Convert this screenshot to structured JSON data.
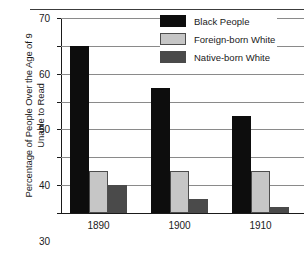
{
  "chart_data": {
    "type": "bar",
    "title": "",
    "xlabel": "",
    "ylabel_line1": "Percentage of People Over the Age of 9",
    "ylabel_line2": "Unable to Read",
    "categories": [
      "1890",
      "1900",
      "1910"
    ],
    "series": [
      {
        "name": "Black People",
        "color": "#0d0d0d",
        "values": [
          60,
          45,
          35
        ]
      },
      {
        "name": "Foreign-born White",
        "color": "#c6c6c6",
        "values": [
          15,
          15,
          15
        ]
      },
      {
        "name": "Native-born White",
        "color": "#4a4a4a",
        "values": [
          10,
          5,
          2
        ]
      }
    ],
    "ylim": [
      0,
      70
    ],
    "ytick_labels": [
      "0",
      "10",
      "20",
      "30",
      "40",
      "50",
      "60",
      "70"
    ],
    "ytick_values": [
      0,
      10,
      20,
      30,
      40,
      50,
      60,
      70
    ],
    "grid": true,
    "legend_position": "top-right"
  },
  "legend": {
    "items": [
      {
        "label": "Black People",
        "swatch": "black-swatch"
      },
      {
        "label": "Foreign-born White",
        "swatch": "light-gray-swatch"
      },
      {
        "label": "Native-born White",
        "swatch": "dark-gray-swatch"
      }
    ]
  },
  "header": {
    "cropped_text": ""
  }
}
